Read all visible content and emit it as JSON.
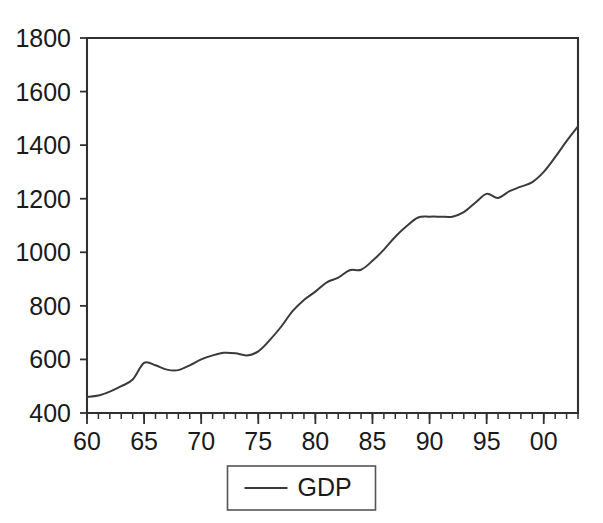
{
  "chart_data": {
    "type": "line",
    "title": "",
    "subtitle": "",
    "xlabel": "",
    "ylabel": "",
    "grid": false,
    "legend_position": "bottom-center",
    "xlim": [
      1960,
      2003
    ],
    "ylim": [
      400,
      1800
    ],
    "ytick_labels": [
      "1800",
      "1600",
      "1400",
      "1200",
      "1000",
      "800",
      "600",
      "400"
    ],
    "ytick_values": [
      1800,
      1600,
      1400,
      1200,
      1000,
      800,
      600,
      400
    ],
    "xtick_labels": [
      "60",
      "65",
      "70",
      "75",
      "80",
      "85",
      "90",
      "95",
      "00"
    ],
    "xtick_values": [
      1960,
      1965,
      1970,
      1975,
      1980,
      1985,
      1990,
      1995,
      2000
    ],
    "minor_xticks_every": 1,
    "x": [
      1960,
      1961,
      1962,
      1963,
      1964,
      1965,
      1966,
      1967,
      1968,
      1969,
      1970,
      1971,
      1972,
      1973,
      1974,
      1975,
      1976,
      1977,
      1978,
      1979,
      1980,
      1981,
      1982,
      1983,
      1984,
      1985,
      1986,
      1987,
      1988,
      1989,
      1990,
      1991,
      1992,
      1993,
      1994,
      1995,
      1996,
      1997,
      1998,
      1999,
      2000,
      2001,
      2002,
      2003
    ],
    "series": [
      {
        "name": "GDP",
        "color": "#3a3a3a",
        "values": [
          460,
          465,
          480,
          500,
          525,
          587,
          578,
          562,
          560,
          578,
          600,
          615,
          625,
          623,
          615,
          630,
          672,
          722,
          780,
          822,
          853,
          888,
          905,
          933,
          935,
          968,
          1010,
          1058,
          1098,
          1130,
          1133,
          1133,
          1133,
          1150,
          1185,
          1218,
          1203,
          1228,
          1245,
          1262,
          1300,
          1355,
          1415,
          1470
        ]
      }
    ],
    "legend": [
      {
        "label": "GDP",
        "color": "#3a3a3a",
        "marker": "line"
      }
    ],
    "annotations": []
  },
  "legend": {
    "gdp_label": "GDP"
  },
  "colors": {
    "series": "#3a3a3a",
    "frame": "#303030",
    "text": "#1a1a1a",
    "background": "#ffffff"
  }
}
